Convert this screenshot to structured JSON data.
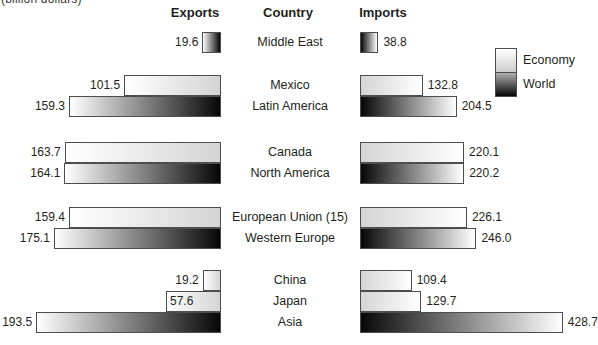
{
  "chart_data": {
    "type": "bar",
    "orientation": "horizontal-diverging",
    "unit_label": "(billion dollars)",
    "column_headers": {
      "exports": "Exports",
      "country": "Country",
      "imports": "Imports"
    },
    "legend": {
      "position": "right",
      "entries": [
        {
          "label": "Economy",
          "swatch": "light-gradient"
        },
        {
          "label": "World",
          "swatch": "dark-gradient"
        }
      ]
    },
    "colors": {
      "economy_far": "#ffffff",
      "economy_baseline": "#d4d4d4",
      "world_far": "#ffffff",
      "world_baseline": "#070707",
      "bar_border": "#4d4d4d",
      "text": "#231f20"
    },
    "groups": [
      {
        "rows": [
          {
            "country": "Middle East",
            "series": "World",
            "exports": 19.6,
            "imports": 38.8
          }
        ]
      },
      {
        "rows": [
          {
            "country": "Mexico",
            "series": "Economy",
            "exports": 101.5,
            "imports": 132.8
          },
          {
            "country": "Latin America",
            "series": "World",
            "exports": 159.3,
            "imports": 204.5
          }
        ]
      },
      {
        "rows": [
          {
            "country": "Canada",
            "series": "Economy",
            "exports": 163.7,
            "imports": 220.1
          },
          {
            "country": "North America",
            "series": "World",
            "exports": 164.1,
            "imports": 220.2
          }
        ]
      },
      {
        "rows": [
          {
            "country": "European Union (15)",
            "series": "Economy",
            "exports": 159.4,
            "imports": 226.1
          },
          {
            "country": "Western Europe",
            "series": "World",
            "exports": 175.1,
            "imports": 246.0
          }
        ]
      },
      {
        "rows": [
          {
            "country": "China",
            "series": "Economy",
            "exports": 19.2,
            "imports": 109.4,
            "exports_label_inside": false
          },
          {
            "country": "Japan",
            "series": "Economy",
            "exports": 57.6,
            "imports": 129.7,
            "exports_label_inside": true
          },
          {
            "country": "Asia",
            "series": "World",
            "exports": 193.5,
            "imports": 428.7
          }
        ]
      }
    ]
  }
}
